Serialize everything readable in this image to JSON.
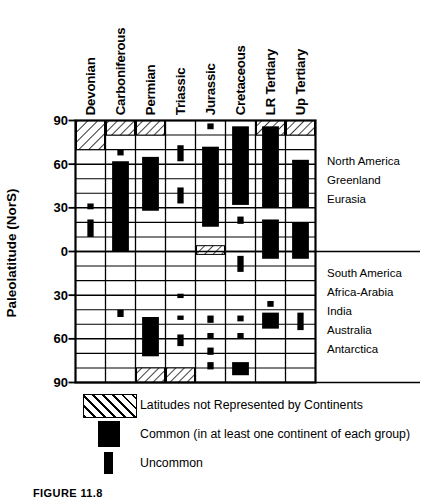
{
  "figure": {
    "caption": "FIGURE 11.8",
    "y_axis_title": "Paleolatitude (NorS)"
  },
  "chart_data": {
    "type": "bar",
    "title": "",
    "xlabel": "",
    "ylabel": "Paleolatitude (NorS)",
    "ylim": [
      -90,
      90
    ],
    "ytick_labels": [
      "90",
      "60",
      "30",
      "0",
      "30",
      "60",
      "90"
    ],
    "ytick_values": [
      90,
      60,
      30,
      0,
      -30,
      -60,
      -90
    ],
    "grid": true,
    "grid_minor_step": 10,
    "categories": [
      "Devonian",
      "Carboniferous",
      "Permian",
      "Triassic",
      "Jurassic",
      "Cretaceous",
      "LR Tertiary",
      "Up Tertiary"
    ],
    "legend_position": "below",
    "series": [
      {
        "name": "Latitudes not Represented by Continents",
        "style": "hatched",
        "bands": [
          {
            "category": "Devonian",
            "from": 90,
            "to": 70
          },
          {
            "category": "Carboniferous",
            "from": 90,
            "to": 80
          },
          {
            "category": "Permian",
            "from": 90,
            "to": 80
          },
          {
            "category": "LR Tertiary",
            "from": 90,
            "to": 80
          },
          {
            "category": "Up Tertiary",
            "from": 90,
            "to": 80
          },
          {
            "category": "Jurassic",
            "from": 4,
            "to": -2
          },
          {
            "category": "Permian",
            "from": -80,
            "to": -90
          },
          {
            "category": "Triassic",
            "from": -80,
            "to": -90
          }
        ]
      },
      {
        "name": "Common (in at least one continent of each group)",
        "style": "filled-wide",
        "bands": [
          {
            "category": "Carboniferous",
            "from": 62,
            "to": 0
          },
          {
            "category": "Permian",
            "from": 65,
            "to": 28
          },
          {
            "category": "Jurassic",
            "from": 72,
            "to": 17
          },
          {
            "category": "Cretaceous",
            "from": 86,
            "to": 32
          },
          {
            "category": "LR Tertiary",
            "from": 86,
            "to": 30
          },
          {
            "category": "LR Tertiary",
            "from": 22,
            "to": -5
          },
          {
            "category": "Up Tertiary",
            "from": 63,
            "to": 30
          },
          {
            "category": "Up Tertiary",
            "from": 20,
            "to": -5
          },
          {
            "category": "Permian",
            "from": -45,
            "to": -72
          },
          {
            "category": "Cretaceous",
            "from": -76,
            "to": -85
          },
          {
            "category": "LR Tertiary",
            "from": -42,
            "to": -53
          }
        ]
      },
      {
        "name": "Uncommon",
        "style": "filled-narrow",
        "marks": [
          {
            "category": "Devonian",
            "from": 33,
            "to": 29
          },
          {
            "category": "Devonian",
            "from": 22,
            "to": 10
          },
          {
            "category": "Carboniferous",
            "from": 70,
            "to": 66
          },
          {
            "category": "Carboniferous",
            "from": -40,
            "to": -45
          },
          {
            "category": "Triassic",
            "from": 73,
            "to": 62
          },
          {
            "category": "Triassic",
            "from": 44,
            "to": 33
          },
          {
            "category": "Triassic",
            "from": -29,
            "to": -32
          },
          {
            "category": "Triassic",
            "from": -44,
            "to": -47
          },
          {
            "category": "Triassic",
            "from": -57,
            "to": -65
          },
          {
            "category": "Jurassic",
            "from": 88,
            "to": 84
          },
          {
            "category": "Jurassic",
            "from": -44,
            "to": -49
          },
          {
            "category": "Jurassic",
            "from": -56,
            "to": -60
          },
          {
            "category": "Jurassic",
            "from": -66,
            "to": -71
          },
          {
            "category": "Jurassic",
            "from": -76,
            "to": -81
          },
          {
            "category": "Cretaceous",
            "from": 24,
            "to": 19
          },
          {
            "category": "Cretaceous",
            "from": -3,
            "to": -14
          },
          {
            "category": "Cretaceous",
            "from": -44,
            "to": -48
          },
          {
            "category": "Cretaceous",
            "from": -56,
            "to": -60
          },
          {
            "category": "LR Tertiary",
            "from": -34,
            "to": -38
          },
          {
            "category": "Up Tertiary",
            "from": -42,
            "to": -54
          }
        ]
      }
    ]
  },
  "columns": [
    {
      "label": "Devonian"
    },
    {
      "label": "Carboniferous"
    },
    {
      "label": "Permian"
    },
    {
      "label": "Triassic"
    },
    {
      "label": "Jurassic"
    },
    {
      "label": "Cretaceous"
    },
    {
      "label": "LR Tertiary"
    },
    {
      "label": "Up Tertiary"
    }
  ],
  "continents": {
    "northern": [
      "North America",
      "Greenland",
      "Eurasia"
    ],
    "southern": [
      "South America",
      "Africa-Arabia",
      "India",
      "Australia",
      "Antarctica"
    ]
  },
  "legend": [
    {
      "key": "hatched",
      "label": "Latitudes not Represented by Continents"
    },
    {
      "key": "filled-wide",
      "label": "Common (in at least one continent of each group)"
    },
    {
      "key": "filled-narrow",
      "label": "Uncommon"
    }
  ],
  "colors": {
    "ink": "#000000",
    "paper": "#ffffff",
    "hatch": "#000000"
  }
}
